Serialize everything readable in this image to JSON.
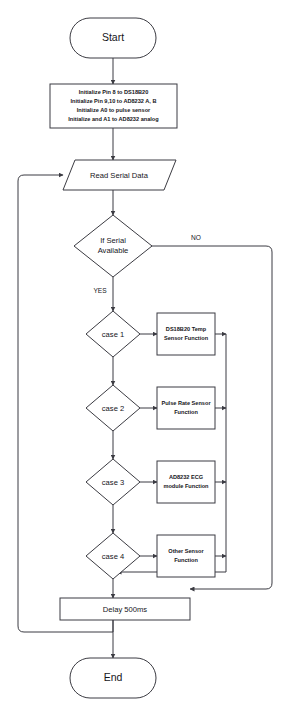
{
  "diagram": {
    "colors": {
      "stroke": "#3b3b42",
      "text": "#15151a",
      "background": "#ffffff"
    },
    "nodes": {
      "start": {
        "label": "Start",
        "shape": "terminator"
      },
      "initialize": {
        "shape": "process",
        "lines": [
          "Initialize Pin 8 to DS18B20",
          "Initialize Pin 9,10 to AD8232 A, B",
          "Initialize A0 to pulse sensor",
          "Initialize and A1 to AD8232 analog"
        ]
      },
      "read_serial": {
        "label": "Read Serial Data",
        "shape": "input-output"
      },
      "if_serial": {
        "shape": "decision",
        "lines": [
          "If Serial",
          "Available"
        ]
      },
      "case1": {
        "label": "case 1",
        "shape": "decision"
      },
      "case2": {
        "label": "case 2",
        "shape": "decision"
      },
      "case3": {
        "label": "case 3",
        "shape": "decision"
      },
      "case4": {
        "label": "case 4",
        "shape": "decision"
      },
      "func1": {
        "shape": "process",
        "lines": [
          "DS18B20 Temp",
          "Sensor Function"
        ]
      },
      "func2": {
        "shape": "process",
        "lines": [
          "Pulse Rate Sensor",
          "Function"
        ]
      },
      "func3": {
        "shape": "process",
        "lines": [
          "AD8232 ECG",
          "module Function"
        ]
      },
      "func4": {
        "shape": "process",
        "lines": [
          "Other Sensor",
          "Function"
        ]
      },
      "delay": {
        "label": "Delay 500ms",
        "shape": "process"
      },
      "end": {
        "label": "End",
        "shape": "terminator"
      }
    },
    "edge_labels": {
      "no": "NO",
      "yes": "YES"
    }
  }
}
